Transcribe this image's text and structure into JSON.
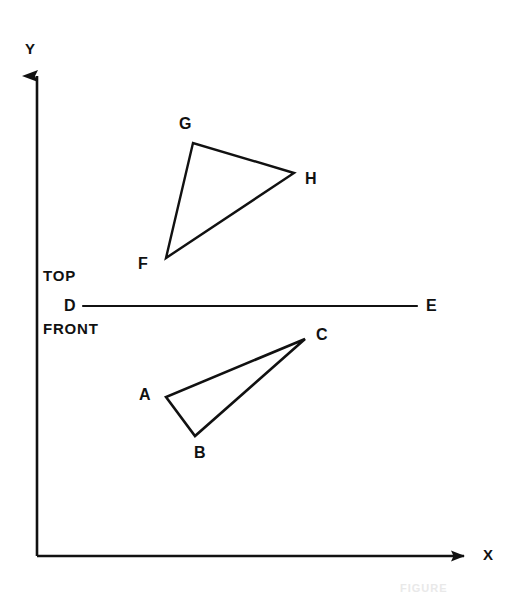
{
  "figure": {
    "background_color": "#ffffff",
    "stroke_color": "#111111",
    "width": 508,
    "height": 595
  },
  "axes": {
    "x_label": "X",
    "y_label": "Y",
    "origin": {
      "x": 37,
      "y": 556
    },
    "x_end": {
      "x": 478,
      "y": 556
    },
    "y_end": {
      "x": 37,
      "y": 62
    }
  },
  "view_labels": {
    "top": "TOP",
    "front": "FRONT"
  },
  "folding_line": {
    "start_label": "D",
    "end_label": "E",
    "start": {
      "x": 83,
      "y": 306
    },
    "end": {
      "x": 417,
      "y": 306
    }
  },
  "shapes": [
    {
      "name": "top-view-triangle",
      "closed": true,
      "vertices": [
        {
          "label": "F",
          "x": 166,
          "y": 258,
          "label_x": 144,
          "label_y": 264
        },
        {
          "label": "G",
          "x": 193,
          "y": 143,
          "label_x": 185,
          "label_y": 124
        },
        {
          "label": "H",
          "x": 294,
          "y": 173,
          "label_x": 311,
          "label_y": 179
        }
      ]
    },
    {
      "name": "front-view-triangle",
      "closed": true,
      "vertices": [
        {
          "label": "A",
          "x": 166,
          "y": 397,
          "label_x": 145,
          "label_y": 395
        },
        {
          "label": "B",
          "x": 195,
          "y": 436,
          "label_x": 200,
          "label_y": 453
        },
        {
          "label": "C",
          "x": 305,
          "y": 339,
          "label_x": 322,
          "label_y": 335
        }
      ]
    }
  ],
  "caption": {
    "text": "FIGURE",
    "visible": "partially-cropped"
  }
}
